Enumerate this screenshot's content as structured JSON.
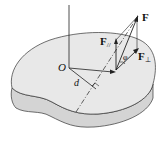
{
  "diagram": {
    "type": "physics-torque-diagram",
    "labels": {
      "force": "F",
      "force_parallel": "F",
      "force_parallel_sub": "//",
      "force_perp": "F",
      "force_perp_sub": "⊥",
      "origin": "O",
      "lever_arm": "d",
      "angle": "φ"
    },
    "colors": {
      "body_top": "#e6e6e6",
      "body_side": "#d2d2d2",
      "stroke": "#222222",
      "background": "#ffffff"
    }
  }
}
